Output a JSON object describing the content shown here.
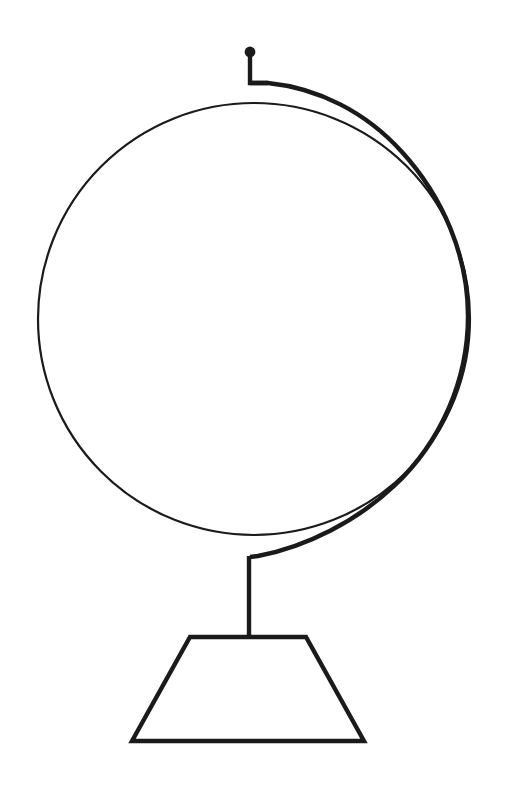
{
  "document": {
    "kind": "line-art-illustration",
    "subject": "desk globe",
    "title": "Globe",
    "caption": "",
    "background_color": "#ffffff",
    "ink_color": "#1a1a1a",
    "canvas": {
      "width": 510,
      "height": 786
    }
  },
  "drawing": {
    "style": "monochrome outline / coloring-book line art",
    "fill": "none",
    "parts": [
      {
        "id": "sphere",
        "label": "globe sphere outline",
        "shape": "circle",
        "cx": 254,
        "cy": 319,
        "r": 216,
        "stroke_width": 2.2,
        "stroke": "#1a1a1a",
        "fill": "none"
      },
      {
        "id": "meridian-ring",
        "label": "meridian support ring",
        "shape": "open-arc",
        "stroke_width": 4.4,
        "stroke": "#1a1a1a",
        "fill": "none",
        "path": "M 250 83 L 268 83 C 360 96 448 188 466 300 C 482 400 436 498 350 540 C 320 554 280 558 250 558",
        "start_point": [
          250,
          83
        ],
        "end_point": [
          250,
          558
        ],
        "max_x": 480
      },
      {
        "id": "axis-pin-stem",
        "label": "axis pin stem",
        "shape": "polyline",
        "stroke_width": 4.4,
        "stroke": "#1a1a1a",
        "points": [
          [
            250,
            55
          ],
          [
            250,
            83
          ],
          [
            268,
            83
          ]
        ]
      },
      {
        "id": "axis-pin-knob",
        "label": "axis pin knob",
        "shape": "filled-circle",
        "cx": 250,
        "cy": 52,
        "r": 5.4,
        "fill": "#1a1a1a"
      },
      {
        "id": "support-stem",
        "label": "vertical support stem",
        "shape": "line",
        "stroke_width": 4.4,
        "stroke": "#1a1a1a",
        "x1": 249,
        "y1": 556,
        "x2": 249,
        "y2": 639
      },
      {
        "id": "base",
        "label": "trapezoidal base",
        "shape": "trapezoid",
        "stroke_width": 4.4,
        "stroke": "#1a1a1a",
        "fill": "none",
        "points": [
          [
            190,
            637
          ],
          [
            306,
            637
          ],
          [
            364,
            741
          ],
          [
            132,
            741
          ]
        ],
        "top_width": 116,
        "bottom_width": 232,
        "height": 104
      }
    ]
  }
}
